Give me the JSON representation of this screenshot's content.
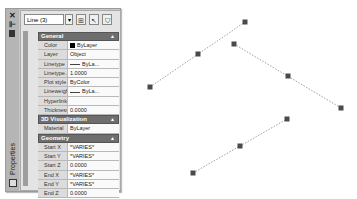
{
  "palette": {
    "title": "Properties",
    "strip_icons": [
      "close-icon",
      "auto-hide-icon",
      "properties-menu-icon"
    ],
    "toolbar": {
      "selection": "Line (3)",
      "buttons": [
        "toggle-pickadd-icon",
        "select-objects-icon",
        "quick-select-icon"
      ]
    },
    "sections": [
      {
        "title": "General",
        "rows": [
          {
            "label": "Color",
            "value": "ByLayer",
            "swatch": "#000000"
          },
          {
            "label": "Layer",
            "value": "Object"
          },
          {
            "label": "Linetype",
            "value": "ByLa...",
            "line": true
          },
          {
            "label": "Linetype...",
            "value": "1.0000"
          },
          {
            "label": "Plot style",
            "value": "ByColor"
          },
          {
            "label": "Lineweight",
            "value": "ByLa...",
            "line": true
          },
          {
            "label": "Hyperlink",
            "value": ""
          },
          {
            "label": "Thickness",
            "value": "0.0000"
          }
        ]
      },
      {
        "title": "3D Visualization",
        "rows": [
          {
            "label": "Material",
            "value": "ByLayer"
          }
        ]
      },
      {
        "title": "Geometry",
        "rows": [
          {
            "label": "Start X",
            "value": "*VARIES*"
          },
          {
            "label": "Start Y",
            "value": "*VARIES*"
          },
          {
            "label": "Start Z",
            "value": "0.0000"
          },
          {
            "label": "End X",
            "value": "*VARIES*"
          },
          {
            "label": "End Y",
            "value": "*VARIES*"
          },
          {
            "label": "End Z",
            "value": "0.0000"
          }
        ]
      }
    ]
  },
  "drawing": {
    "lines": [
      {
        "start": [
          150,
          87
        ],
        "mid": [
          198,
          54
        ],
        "end": [
          245,
          22
        ]
      },
      {
        "start": [
          234,
          44
        ],
        "mid": [
          288,
          76
        ],
        "end": [
          341,
          108
        ]
      },
      {
        "start": [
          193,
          173
        ],
        "mid": [
          240,
          146
        ],
        "end": [
          287,
          119
        ]
      }
    ],
    "grip_color": "#4a4a4a",
    "line_color": "#888888"
  }
}
